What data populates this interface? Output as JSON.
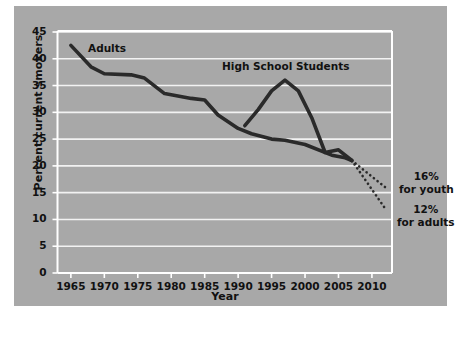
{
  "chart_data": {
    "type": "line",
    "title": "",
    "xlabel": "Year",
    "ylabel": "Percent current smokers",
    "xlim": [
      1963,
      2013
    ],
    "ylim": [
      0,
      45
    ],
    "xticks": [
      "1965",
      "1970",
      "1975",
      "1980",
      "1985",
      "1990",
      "1995",
      "2000",
      "2005",
      "2010"
    ],
    "yticks": [
      "0",
      "5",
      "10",
      "15",
      "20",
      "25",
      "30",
      "35",
      "40",
      "45"
    ],
    "grid": true,
    "legend": "inline-labels",
    "series": [
      {
        "name": "Adults",
        "style": "solid",
        "x": [
          1965,
          1968,
          1970,
          1974,
          1976,
          1979,
          1983,
          1985,
          1987,
          1990,
          1992,
          1995,
          1997,
          2000,
          2004,
          2006,
          2007
        ],
        "values": [
          42.5,
          38.5,
          37.2,
          37.0,
          36.4,
          33.5,
          32.6,
          32.3,
          29.5,
          27.0,
          26.0,
          25.0,
          24.8,
          24.0,
          22.0,
          21.5,
          21.0
        ]
      },
      {
        "name": "High School Students",
        "style": "solid",
        "x": [
          1991,
          1993,
          1995,
          1997,
          1999,
          2001,
          2003,
          2005,
          2007
        ],
        "values": [
          27.5,
          30.5,
          34.0,
          36.0,
          34.0,
          29.0,
          22.5,
          23.0,
          21.0
        ]
      },
      {
        "name": "Projection for youth",
        "style": "dotted",
        "x": [
          2007,
          2012
        ],
        "values": [
          21.0,
          16.0
        ]
      },
      {
        "name": "Projection for adults",
        "style": "dotted",
        "x": [
          2007,
          2012
        ],
        "values": [
          21.0,
          12.0
        ]
      }
    ],
    "annotations": [
      {
        "name": "adults-series-label",
        "text": "Adults"
      },
      {
        "name": "high-school-series-label",
        "text": "High School Students"
      },
      {
        "name": "youth-target-annotation",
        "line1": "16%",
        "line2": "for youth"
      },
      {
        "name": "adults-target-annotation",
        "line1": "12%",
        "line2": "for adults"
      }
    ]
  },
  "colors": {
    "panel_background": "#a8a8a8",
    "gridline": "#f2f2f2",
    "axis": "#ffffff",
    "line": "#2a2a2a",
    "text": "#111111"
  }
}
